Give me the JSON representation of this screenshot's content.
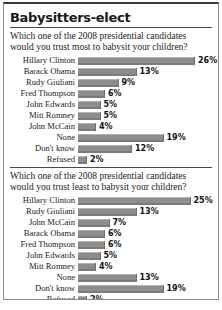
{
  "headline": "Babysitters-elect",
  "source_line": "Source: Parents Magazine",
  "credit_line": "",
  "colors": {
    "bar": "#8d8d8d",
    "bar_highlight": "#b4b4b4",
    "text": "#1a1a1a",
    "frame": "#8d8d8d"
  },
  "chart_data": [
    {
      "type": "bar",
      "orientation": "horizontal",
      "title": "Which one of the 2008 presidential candidates would you trust most to babysit your children?",
      "xlabel": "",
      "ylabel": "",
      "xlim": [
        0,
        26
      ],
      "grid": false,
      "legend": "none",
      "value_suffix": "%",
      "categories": [
        "Hillary Clinton",
        "Barack Obama",
        "Rudy Giuliani",
        "Fred Thompson",
        "John Edwards",
        "Mitt Romney",
        "John McCain",
        "None",
        "Don't know",
        "Refused"
      ],
      "values": [
        26,
        13,
        9,
        6,
        5,
        5,
        4,
        19,
        12,
        2
      ],
      "labels": [
        "26%",
        "13%",
        "9%",
        "6%",
        "5%",
        "5%",
        "4%",
        "19%",
        "12%",
        "2%"
      ]
    },
    {
      "type": "bar",
      "orientation": "horizontal",
      "title": "Which one of the 2008 presidential candidates would you trust least to babysit your children?",
      "xlabel": "",
      "ylabel": "",
      "xlim": [
        0,
        26
      ],
      "grid": false,
      "legend": "none",
      "value_suffix": "%",
      "categories": [
        "Hillary Clinton",
        "Rudy Giuliani",
        "John McCain",
        "Barack Obama",
        "Fred Thompson",
        "John Edwards",
        "Mitt Romney",
        "None",
        "Don't know",
        "Refused"
      ],
      "values": [
        25,
        13,
        7,
        6,
        6,
        5,
        4,
        13,
        19,
        2
      ],
      "labels": [
        "25%",
        "13%",
        "7%",
        "6%",
        "6%",
        "5%",
        "4%",
        "13%",
        "19%",
        "2%"
      ]
    }
  ]
}
